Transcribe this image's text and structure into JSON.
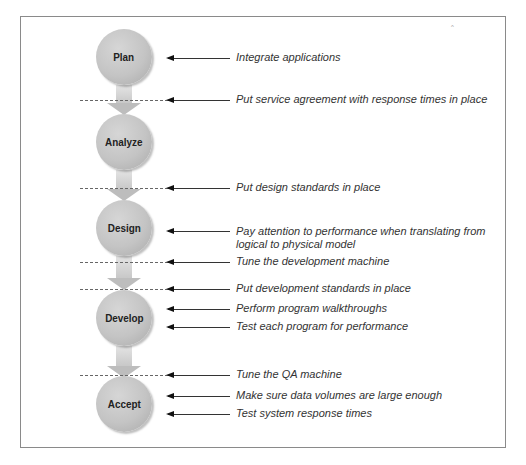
{
  "diagram": {
    "phases": [
      {
        "label": "Plan",
        "cy": 57
      },
      {
        "label": "Analyze",
        "cy": 142
      },
      {
        "label": "Design",
        "cy": 228
      },
      {
        "label": "Develop",
        "cy": 318
      },
      {
        "label": "Accept",
        "cy": 404
      }
    ],
    "annotations": [
      {
        "text": "Integrate applications",
        "y": 58,
        "dashed": false
      },
      {
        "text": "Put service agreement with response times in place",
        "y": 100,
        "dashed": true
      },
      {
        "text": "Put design standards in place",
        "y": 188,
        "dashed": true
      },
      {
        "text": "Pay attention to performance when translating from",
        "text2": "logical to physical model",
        "y": 232,
        "dashed": false
      },
      {
        "text": "Tune the development machine",
        "y": 262,
        "dashed": true
      },
      {
        "text": "Put development standards in place",
        "y": 289,
        "dashed": true
      },
      {
        "text": "Perform program walkthroughs",
        "y": 309,
        "dashed": false
      },
      {
        "text": "Test each program for performance",
        "y": 327,
        "dashed": false
      },
      {
        "text": "Tune the QA machine",
        "y": 375,
        "dashed": true
      },
      {
        "text": "Make sure data volumes are large enough",
        "y": 396,
        "dashed": false
      },
      {
        "text": "Test system response times",
        "y": 414,
        "dashed": false
      }
    ]
  }
}
